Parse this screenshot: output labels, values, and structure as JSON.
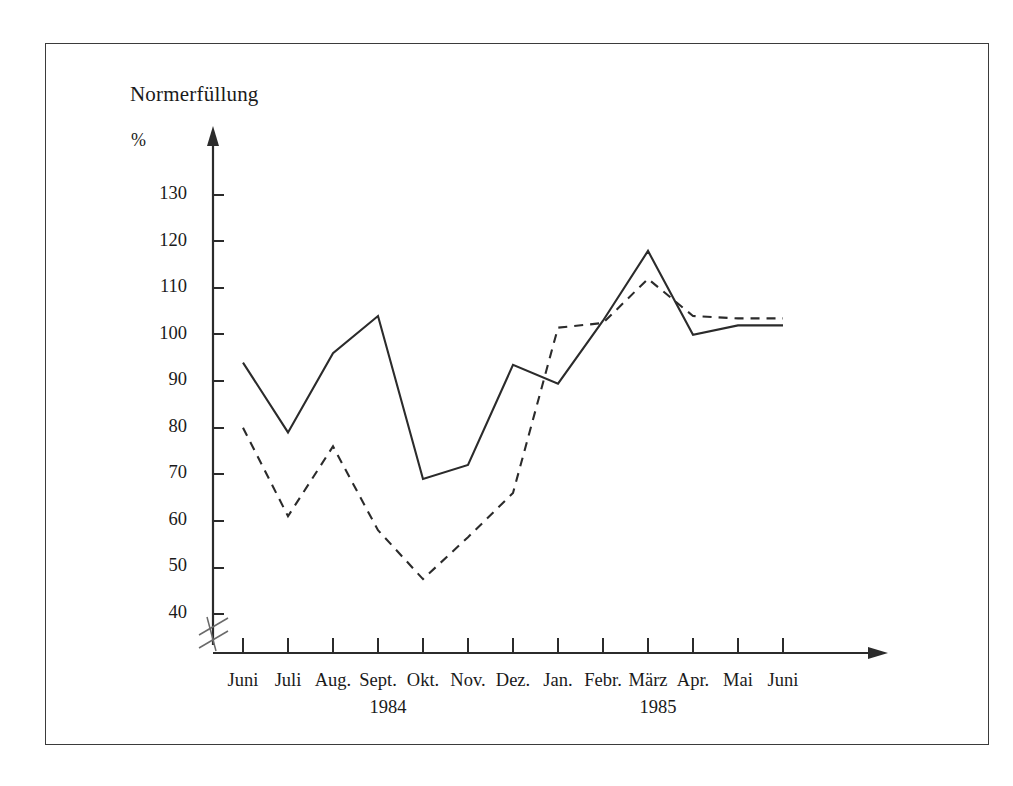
{
  "figure": {
    "title": "Normerfüllung",
    "y_unit_label": "%",
    "frame_color": "#3b3b3b",
    "line_color": "#2b2b2b",
    "background": "#ffffff"
  },
  "axis": {
    "y_ticks": [
      "130",
      "120",
      "110",
      "100",
      "90",
      "80",
      "70",
      "60",
      "50",
      "40"
    ],
    "y_break_note": "axis break below 40",
    "x_ticks": [
      "Juni",
      "Juli",
      "Aug.",
      "Sept.",
      "Okt.",
      "Nov.",
      "Dez.",
      "Jan.",
      "Febr.",
      "März",
      "Apr.",
      "Mai",
      "Juni"
    ],
    "year_labels": [
      {
        "text": "1984",
        "after_tick_index": 3
      },
      {
        "text": "1985",
        "after_tick_index": 9
      }
    ]
  },
  "chart_data": {
    "type": "line",
    "title": "Normerfüllung",
    "xlabel": "",
    "ylabel": "%",
    "ylim": [
      40,
      130
    ],
    "yticks": [
      40,
      50,
      60,
      70,
      80,
      90,
      100,
      110,
      120,
      130
    ],
    "grid": false,
    "legend": "none",
    "axis_break_y": true,
    "categories": [
      "Juni",
      "Juli",
      "Aug.",
      "Sept.",
      "Okt.",
      "Nov.",
      "Dez.",
      "Jan.",
      "Febr.",
      "März",
      "Apr.",
      "Mai",
      "Juni"
    ],
    "category_years": [
      "1984",
      "1984",
      "1984",
      "1984",
      "1984",
      "1984",
      "1984",
      "1985",
      "1985",
      "1985",
      "1985",
      "1985",
      "1985"
    ],
    "series": [
      {
        "name": "solid-series",
        "style": "solid",
        "values": [
          94,
          79,
          96,
          104,
          69,
          72,
          93.5,
          89.5,
          103,
          118,
          100,
          102,
          102
        ]
      },
      {
        "name": "dashed-series",
        "style": "dashed",
        "values": [
          80,
          61,
          76,
          58,
          47.5,
          56.5,
          66,
          101.5,
          102.5,
          112,
          104,
          103.5,
          103.5
        ]
      }
    ]
  }
}
